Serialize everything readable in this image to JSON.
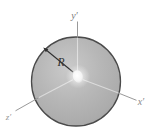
{
  "figure": {
    "type": "disk-with-body-fixed-axes",
    "labels": {
      "y_axis": "y′",
      "x_axis": "x′",
      "z_axis": "z′",
      "radius": "R"
    },
    "colors": {
      "background": "#ffffff",
      "disk_fill_mid": "#b5b5b5",
      "disk_highlight": "#cacaca",
      "disk_edge_shade": "#9c9c9c",
      "disk_outline": "#4a4a4a",
      "axis_line": "#8d8d8d",
      "inner_line": "#d8d8d8",
      "arrow": "#2f2f2f",
      "y_label_color": "#787878",
      "x_label_color": "#8a8a8a",
      "z_label_color": "#979797",
      "radius_label_color": "#333333",
      "center_point": "#ffffff"
    }
  }
}
